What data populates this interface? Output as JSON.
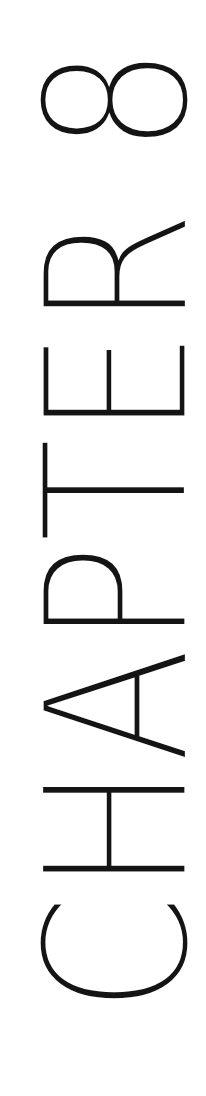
{
  "page": {
    "background": "#ffffff",
    "text_color": "#141414"
  },
  "heading": {
    "text": "CHAPTER 8",
    "orientation": "rotated-90-counterclockwise"
  }
}
